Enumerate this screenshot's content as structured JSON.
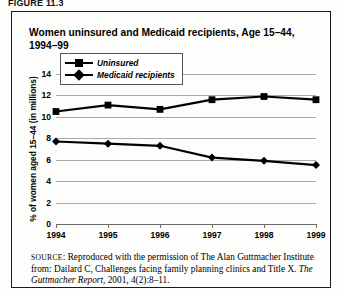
{
  "figure_label": "FIGURE 11.3",
  "chart_data": {
    "type": "line",
    "title": "Women uninsured and Medicaid recipients, Age 15–44, 1994–99",
    "xlabel": "",
    "ylabel": "% of women aged 15–44 (in millions)",
    "categories": [
      "1994",
      "1995",
      "1996",
      "1997",
      "1998",
      "1999"
    ],
    "series": [
      {
        "name": "Uninsured",
        "marker": "square",
        "values": [
          10.5,
          11.1,
          10.7,
          11.6,
          11.9,
          11.6
        ]
      },
      {
        "name": "Medicaid recipients",
        "marker": "diamond",
        "values": [
          7.7,
          7.5,
          7.3,
          6.2,
          5.9,
          5.5
        ]
      }
    ],
    "ylim": [
      0,
      14
    ],
    "yticks": [
      0,
      2,
      4,
      6,
      8,
      10,
      12,
      14
    ],
    "grid": true,
    "legend_position": "inside-lower-left",
    "line_color": "#000000",
    "grid_color": "#a9a9a9"
  },
  "legend": {
    "items": [
      {
        "label": "Uninsured"
      },
      {
        "label": "Medicaid recipients"
      }
    ]
  },
  "source": {
    "prefix": "SOURCE",
    "text_before_italic": ": Reproduced with the permission of The Alan Guttmacher Institute from: Dailard C, Challenges facing family planning clinics and Title X. ",
    "italic_title": "The Guttmacher Report",
    "text_after_italic": ", 2001, 4(2):8–11."
  }
}
